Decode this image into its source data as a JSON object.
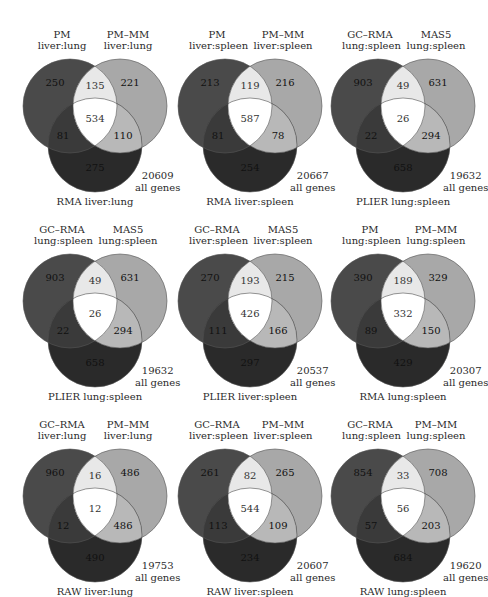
{
  "colors": {
    "circle_a": "#4a4a4a",
    "circle_b": "#a8a8a8",
    "circle_c": "#2a2a2a",
    "ab_only": "#e8e8e8",
    "abc": "#ffffff",
    "ac_only": "#3a3a3a",
    "bc_only": "#b8b8b8",
    "outline": "#555555",
    "text": "#2a2a2a"
  },
  "diagrams": [
    {
      "top_left_label": [
        "PM",
        "liver:lung"
      ],
      "top_right_label": [
        "PM–MM",
        "liver:lung"
      ],
      "bottom_label": "RMA liver:lung",
      "a_only": "250",
      "b_only": "221",
      "ab": "135",
      "abc": "534",
      "ac": "81",
      "bc": "110",
      "c_only": "275",
      "total": "20609",
      "total_label": "all genes"
    },
    {
      "top_left_label": [
        "PM",
        "liver:spleen"
      ],
      "top_right_label": [
        "PM–MM",
        "liver:spleen"
      ],
      "bottom_label": "RMA liver:spleen",
      "a_only": "213",
      "b_only": "216",
      "ab": "119",
      "abc": "587",
      "ac": "81",
      "bc": "78",
      "c_only": "254",
      "total": "20667",
      "total_label": "all genes"
    },
    {
      "top_left_label": [
        "GC–RMA",
        "lung:spleen"
      ],
      "top_right_label": [
        "MAS5",
        "lung:spleen"
      ],
      "bottom_label": "PLIER lung:spleen",
      "a_only": "903",
      "b_only": "631",
      "ab": "49",
      "abc": "26",
      "ac": "22",
      "bc": "294",
      "c_only": "658",
      "total": "19632",
      "total_label": "all genes"
    },
    {
      "top_left_label": [
        "GC–RMA",
        "lung:spleen"
      ],
      "top_right_label": [
        "MAS5",
        "lung:spleen"
      ],
      "bottom_label": "PLIER lung:spleen",
      "a_only": "903",
      "b_only": "631",
      "ab": "49",
      "abc": "26",
      "ac": "22",
      "bc": "294",
      "c_only": "658",
      "total": "19632",
      "total_label": "all genes"
    },
    {
      "top_left_label": [
        "GC–RMA",
        "liver:spleen"
      ],
      "top_right_label": [
        "MAS5",
        "liver:spleen"
      ],
      "bottom_label": "PLIER liver:spleen",
      "a_only": "270",
      "b_only": "215",
      "ab": "193",
      "abc": "426",
      "ac": "111",
      "bc": "166",
      "c_only": "297",
      "total": "20537",
      "total_label": "all genes"
    },
    {
      "top_left_label": [
        "PM",
        "lung:spleen"
      ],
      "top_right_label": [
        "PM–MM",
        "lung:spleen"
      ],
      "bottom_label": "RMA lung:spleen",
      "a_only": "390",
      "b_only": "329",
      "ab": "189",
      "abc": "332",
      "ac": "89",
      "bc": "150",
      "c_only": "429",
      "total": "20307",
      "total_label": "all genes"
    },
    {
      "top_left_label": [
        "GC–RMA",
        "liver:lung"
      ],
      "top_right_label": [
        "PM–MM",
        "liver:lung"
      ],
      "bottom_label": "RAW liver:lung",
      "a_only": "960",
      "b_only": "486",
      "ab": "16",
      "abc": "12",
      "ac": "12",
      "bc": "486",
      "c_only": "490",
      "total": "19753",
      "total_label": "all genes"
    },
    {
      "top_left_label": [
        "GC–RMA",
        "liver:spleen"
      ],
      "top_right_label": [
        "PM–MM",
        "liver:spleen"
      ],
      "bottom_label": "RAW liver:spleen",
      "a_only": "261",
      "b_only": "265",
      "ab": "82",
      "abc": "544",
      "ac": "113",
      "bc": "109",
      "c_only": "234",
      "total": "20607",
      "total_label": "all genes"
    },
    {
      "top_left_label": [
        "GC–RMA",
        "lung:spleen"
      ],
      "top_right_label": [
        "PM–MM",
        "lung:spleen"
      ],
      "bottom_label": "RAW lung:spleen",
      "a_only": "854",
      "b_only": "708",
      "ab": "33",
      "abc": "56",
      "ac": "57",
      "bc": "203",
      "c_only": "684",
      "total": "19620",
      "total_label": "all genes"
    }
  ]
}
